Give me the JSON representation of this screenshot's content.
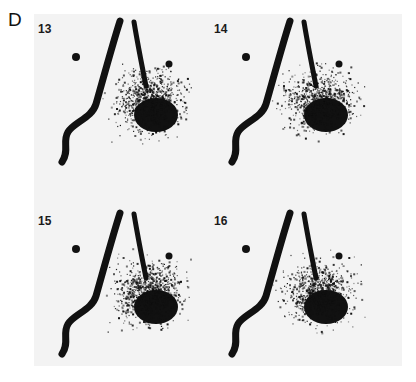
{
  "figure": {
    "label": "D",
    "panels": [
      {
        "number": "13"
      },
      {
        "number": "14"
      },
      {
        "number": "15"
      },
      {
        "number": "16"
      }
    ]
  },
  "colors": {
    "ink": "#111111",
    "background": "#f3f3f3"
  }
}
